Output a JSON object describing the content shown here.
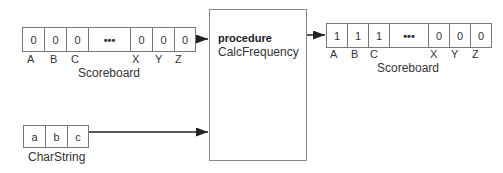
{
  "input_scoreboard": {
    "cells": [
      "0",
      "0",
      "0",
      "•••",
      "0",
      "0",
      "0"
    ],
    "letters": [
      "A",
      "B",
      "C",
      "X",
      "Y",
      "Z"
    ],
    "caption": "Scoreboard"
  },
  "procedure": {
    "keyword": "procedure",
    "name": "CalcFrequency"
  },
  "output_scoreboard": {
    "cells": [
      "1",
      "1",
      "1",
      "•••",
      "0",
      "0",
      "0"
    ],
    "letters": [
      "A",
      "B",
      "C",
      "X",
      "Y",
      "Z"
    ],
    "caption": "Scoreboard"
  },
  "char_string": {
    "cells": [
      "a",
      "b",
      "c"
    ],
    "caption": "CharString"
  }
}
